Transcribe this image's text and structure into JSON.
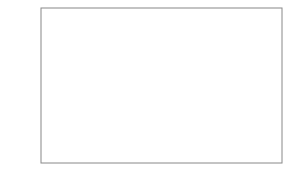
{
  "chart_data": {
    "type": "bar",
    "orientation": "horizontal-range",
    "title": "",
    "xlabel": "",
    "x_unit": "(Gy)",
    "xscale": "log",
    "xlim": [
      1,
      10000
    ],
    "x_ticks": [
      "1",
      "10",
      "100",
      "1000",
      "10000"
    ],
    "grid": "vertical",
    "categories": [
      "昆虫",
      "甲殻類",
      "は虫類",
      "魚類",
      "鳥類",
      "ほ乳類"
    ],
    "ranges": [
      {
        "label": "昆虫",
        "min": 18,
        "max": 2800,
        "color": "#3555a6",
        "label_color": "#2f4a8e"
      },
      {
        "label": "甲殻類",
        "min": 13,
        "max": 170,
        "color": "#4fb5be",
        "label_color": "#4ab3c0"
      },
      {
        "label": "は虫類",
        "min": 7,
        "max": 42,
        "color": "#3555a6",
        "label_color": "#2f4a8e"
      },
      {
        "label": "魚類",
        "min": 3.2,
        "max": 62,
        "color": "#4fb5be",
        "label_color": "#4ab3c0"
      },
      {
        "label": "鳥類",
        "min": 2.9,
        "max": 26,
        "color": "#3555a6",
        "label_color": "#2f4a8e"
      },
      {
        "label": "ほ乳類",
        "min": 1.6,
        "max": 16.6,
        "color": "#4fb5be",
        "label_color": "#4ab3c0"
      }
    ]
  }
}
